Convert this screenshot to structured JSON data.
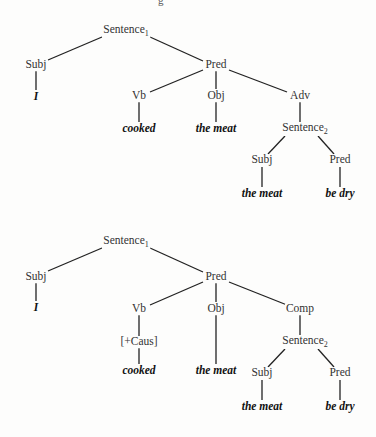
{
  "header_fragment": "g",
  "trees": [
    {
      "name": "tree-1",
      "nodes": {
        "s1": {
          "label": "Sentence",
          "sub": "1",
          "x": 126,
          "y": 31
        },
        "subj": {
          "label": "Subj",
          "x": 36,
          "y": 65
        },
        "i": {
          "label": "I",
          "x": 36,
          "y": 97,
          "leaf": true
        },
        "pred": {
          "label": "Pred",
          "x": 216,
          "y": 65
        },
        "vb": {
          "label": "Vb",
          "x": 139,
          "y": 96
        },
        "obj": {
          "label": "Obj",
          "x": 216,
          "y": 96
        },
        "adv": {
          "label": "Adv",
          "x": 300,
          "y": 96
        },
        "cooked": {
          "label": "cooked",
          "x": 139,
          "y": 129,
          "leaf": true
        },
        "meat1": {
          "label": "the meat",
          "x": 216,
          "y": 129,
          "leaf": true
        },
        "s2": {
          "label": "Sentence",
          "sub": "2",
          "x": 305,
          "y": 129
        },
        "subj2": {
          "label": "Subj",
          "x": 262,
          "y": 160
        },
        "pred2": {
          "label": "Pred",
          "x": 340,
          "y": 160
        },
        "meat2": {
          "label": "the meat",
          "x": 262,
          "y": 194,
          "leaf": true
        },
        "bedry": {
          "label": "be dry",
          "x": 340,
          "y": 194,
          "leaf": true
        }
      }
    },
    {
      "name": "tree-2",
      "nodes": {
        "s1": {
          "label": "Sentence",
          "sub": "1",
          "x": 126,
          "y": 242
        },
        "subj": {
          "label": "Subj",
          "x": 36,
          "y": 277
        },
        "i": {
          "label": "I",
          "x": 36,
          "y": 308,
          "leaf": true
        },
        "pred": {
          "label": "Pred",
          "x": 216,
          "y": 277
        },
        "vb": {
          "label": "Vb",
          "x": 139,
          "y": 309
        },
        "caus": {
          "label": "[+Caus]",
          "x": 139,
          "y": 342
        },
        "obj": {
          "label": "Obj",
          "x": 216,
          "y": 309
        },
        "comp": {
          "label": "Comp",
          "x": 300,
          "y": 309
        },
        "cooked": {
          "label": "cooked",
          "x": 139,
          "y": 371,
          "leaf": true
        },
        "meat1": {
          "label": "the meat",
          "x": 216,
          "y": 371,
          "leaf": true
        },
        "s2": {
          "label": "Sentence",
          "sub": "2",
          "x": 305,
          "y": 342
        },
        "subj2": {
          "label": "Subj",
          "x": 262,
          "y": 373
        },
        "pred2": {
          "label": "Pred",
          "x": 340,
          "y": 373
        },
        "meat2": {
          "label": "the meat",
          "x": 262,
          "y": 407,
          "leaf": true
        },
        "bedry": {
          "label": "be dry",
          "x": 340,
          "y": 407,
          "leaf": true
        }
      }
    }
  ]
}
